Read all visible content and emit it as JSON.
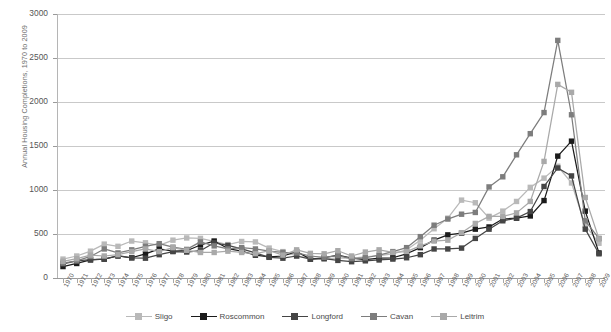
{
  "axes": {
    "ylabel": "Annual Housing Completions, 1970 to 2009",
    "yticks": [
      "3000",
      "2500",
      "2000",
      "1500",
      "1000",
      "500",
      "0"
    ],
    "xlabels": [
      "1970",
      "1971",
      "1972",
      "1973",
      "1974",
      "1975",
      "1976",
      "1977",
      "1978",
      "1979",
      "1980",
      "1981",
      "1982",
      "1983",
      "1984",
      "1985",
      "1986",
      "1987",
      "1988",
      "1989",
      "1990",
      "1991",
      "1992",
      "1993",
      "1994",
      "1995",
      "1996",
      "1997",
      "1998",
      "1999",
      "2000",
      "2001",
      "2002",
      "2003",
      "2004",
      "2005",
      "2006",
      "2007",
      "2008",
      "2009"
    ]
  },
  "legend": {
    "items": [
      {
        "label": "Sligo",
        "color": "#b9b9b9"
      },
      {
        "label": "Roscommon",
        "color": "#1b1b1b"
      },
      {
        "label": "Longford",
        "color": "#454545"
      },
      {
        "label": "Cavan",
        "color": "#7d7d7d"
      },
      {
        "label": "Leitrim",
        "color": "#a9a9a9"
      }
    ]
  },
  "chart_data": {
    "type": "line",
    "title": "",
    "xlabel": "",
    "ylabel": "Annual Housing Completions, 1970 to 2009",
    "ylim": [
      0,
      3000
    ],
    "ytick_step": 500,
    "grid": true,
    "legend_position": "bottom",
    "markers": "square",
    "x": [
      1970,
      1971,
      1972,
      1973,
      1974,
      1975,
      1976,
      1977,
      1978,
      1979,
      1980,
      1981,
      1982,
      1983,
      1984,
      1985,
      1986,
      1987,
      1988,
      1989,
      1990,
      1991,
      1992,
      1993,
      1994,
      1995,
      1996,
      1997,
      1998,
      1999,
      2000,
      2001,
      2002,
      2003,
      2004,
      2005,
      2006,
      2007,
      2008,
      2009
    ],
    "series": [
      {
        "name": "Sligo",
        "color": "#b9b9b9",
        "values": [
          215,
          250,
          305,
          385,
          360,
          420,
          400,
          370,
          430,
          455,
          450,
          415,
          380,
          415,
          410,
          340,
          300,
          250,
          225,
          215,
          230,
          225,
          240,
          255,
          275,
          320,
          430,
          560,
          680,
          885,
          855,
          680,
          760,
          870,
          1030,
          1135,
          1270,
          1080,
          600,
          395
        ]
      },
      {
        "name": "Roscommon",
        "color": "#1b1b1b",
        "values": [
          130,
          165,
          205,
          215,
          250,
          230,
          275,
          330,
          305,
          310,
          375,
          420,
          335,
          305,
          260,
          240,
          250,
          300,
          215,
          230,
          260,
          225,
          210,
          225,
          230,
          275,
          345,
          430,
          490,
          510,
          555,
          580,
          670,
          680,
          705,
          880,
          1385,
          1555,
          760,
          285
        ]
      },
      {
        "name": "Longford",
        "color": "#454545",
        "values": [
          160,
          195,
          210,
          215,
          255,
          230,
          225,
          265,
          300,
          295,
          310,
          400,
          370,
          330,
          285,
          235,
          225,
          250,
          215,
          220,
          200,
          185,
          195,
          205,
          215,
          230,
          265,
          330,
          330,
          340,
          450,
          555,
          650,
          680,
          755,
          1040,
          1250,
          1160,
          555,
          275
        ]
      },
      {
        "name": "Cavan",
        "color": "#7d7d7d",
        "values": [
          170,
          195,
          245,
          330,
          285,
          320,
          360,
          390,
          350,
          325,
          410,
          365,
          330,
          345,
          330,
          305,
          290,
          285,
          250,
          235,
          255,
          220,
          230,
          260,
          300,
          345,
          470,
          600,
          670,
          725,
          745,
          1035,
          1150,
          1400,
          1640,
          1880,
          2700,
          1855,
          650,
          450
        ]
      },
      {
        "name": "Leitrim",
        "color": "#a9a9a9",
        "values": [
          190,
          220,
          260,
          250,
          265,
          300,
          330,
          300,
          345,
          315,
          290,
          290,
          305,
          290,
          275,
          310,
          260,
          320,
          280,
          275,
          310,
          250,
          295,
          320,
          290,
          300,
          365,
          420,
          430,
          515,
          620,
          700,
          700,
          740,
          870,
          1325,
          2200,
          2110,
          915,
          445
        ]
      }
    ]
  }
}
